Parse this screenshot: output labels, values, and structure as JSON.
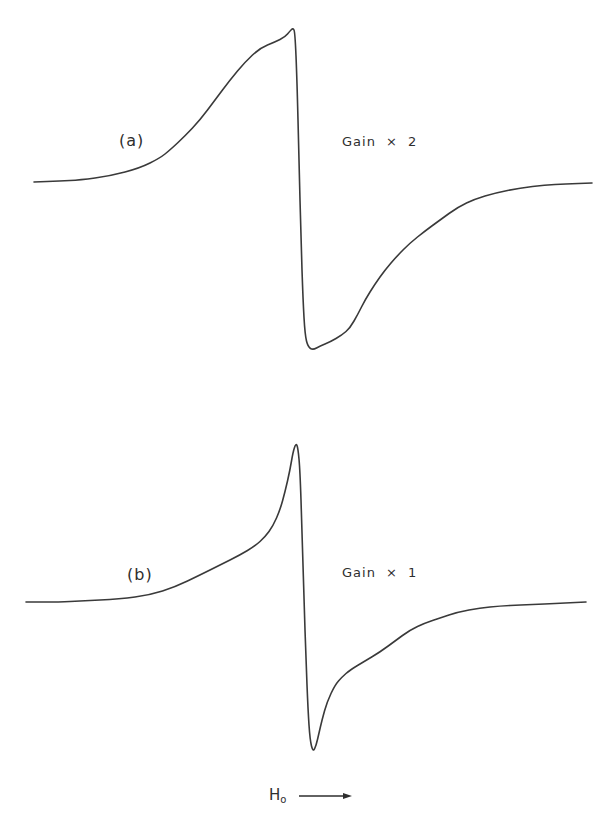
{
  "chart_data": {
    "type": "line",
    "title": "",
    "xlabel": "H₀",
    "xlabel_main": "H",
    "xlabel_sub": "o",
    "ylabel": "",
    "grid": false,
    "legend": null,
    "axis_direction_arrow": "right",
    "units": "pixel coordinates (no numeric axis ticks shown)",
    "panels": [
      {
        "id": "a",
        "label": "(a)",
        "annotation": "Gain × 2",
        "color": "#3a3a3a",
        "baseline_y": 182,
        "points": [
          [
            34,
            182
          ],
          [
            60,
            181
          ],
          [
            80,
            180
          ],
          [
            110,
            176
          ],
          [
            140,
            168
          ],
          [
            160,
            158
          ],
          [
            170,
            150
          ],
          [
            185,
            136
          ],
          [
            200,
            120
          ],
          [
            215,
            100
          ],
          [
            230,
            80
          ],
          [
            245,
            62
          ],
          [
            260,
            48
          ],
          [
            275,
            42
          ],
          [
            285,
            37
          ],
          [
            290,
            31
          ],
          [
            293,
            28
          ],
          [
            295,
            32
          ],
          [
            297,
            80
          ],
          [
            299,
            160
          ],
          [
            301,
            240
          ],
          [
            303,
            300
          ],
          [
            305,
            335
          ],
          [
            308,
            347
          ],
          [
            313,
            350
          ],
          [
            320,
            346
          ],
          [
            330,
            342
          ],
          [
            342,
            335
          ],
          [
            350,
            328
          ],
          [
            358,
            314
          ],
          [
            365,
            300
          ],
          [
            375,
            284
          ],
          [
            385,
            270
          ],
          [
            397,
            256
          ],
          [
            410,
            243
          ],
          [
            425,
            231
          ],
          [
            440,
            220
          ],
          [
            458,
            207
          ],
          [
            475,
            199
          ],
          [
            495,
            193
          ],
          [
            520,
            188
          ],
          [
            545,
            185
          ],
          [
            565,
            184
          ],
          [
            592,
            183
          ]
        ]
      },
      {
        "id": "b",
        "label": "(b)",
        "annotation": "Gain × 1",
        "color": "#3a3a3a",
        "baseline_y": 602,
        "points": [
          [
            26,
            602
          ],
          [
            60,
            602
          ],
          [
            80,
            601
          ],
          [
            120,
            599
          ],
          [
            150,
            595
          ],
          [
            175,
            587
          ],
          [
            200,
            575
          ],
          [
            220,
            565
          ],
          [
            240,
            555
          ],
          [
            255,
            546
          ],
          [
            265,
            537
          ],
          [
            273,
            526
          ],
          [
            280,
            510
          ],
          [
            285,
            492
          ],
          [
            290,
            470
          ],
          [
            293,
            452
          ],
          [
            296,
            443
          ],
          [
            298,
            448
          ],
          [
            300,
            470
          ],
          [
            302,
            530
          ],
          [
            304,
            600
          ],
          [
            306,
            660
          ],
          [
            308,
            710
          ],
          [
            310,
            740
          ],
          [
            313,
            752
          ],
          [
            316,
            746
          ],
          [
            319,
            733
          ],
          [
            322,
            720
          ],
          [
            327,
            702
          ],
          [
            335,
            685
          ],
          [
            342,
            677
          ],
          [
            350,
            670
          ],
          [
            365,
            661
          ],
          [
            380,
            652
          ],
          [
            395,
            641
          ],
          [
            410,
            630
          ],
          [
            425,
            623
          ],
          [
            440,
            618
          ],
          [
            458,
            612
          ],
          [
            480,
            608
          ],
          [
            500,
            606
          ],
          [
            520,
            605
          ],
          [
            545,
            604
          ],
          [
            565,
            603
          ],
          [
            586,
            602
          ]
        ]
      }
    ]
  },
  "labels": {
    "panel_a": "(a)",
    "gain_a": "Gain × 2",
    "panel_b": "(b)",
    "gain_b": "Gain × 1",
    "field_axis_main": "H",
    "field_axis_sub": "o"
  }
}
